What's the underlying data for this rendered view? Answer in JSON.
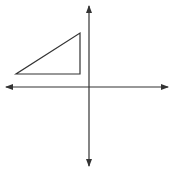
{
  "diagram": {
    "type": "coordinate-plane",
    "colors": {
      "background": "#ffffff",
      "stroke": "#333333"
    },
    "axes": {
      "origin_px": [
        89,
        87
      ],
      "x_axis": {
        "from_px": [
          6,
          87
        ],
        "to_px": [
          168,
          87
        ],
        "arrows": "both"
      },
      "y_axis": {
        "from_px": [
          89,
          6
        ],
        "to_px": [
          89,
          166
        ],
        "arrows": "both"
      }
    },
    "triangle": {
      "shape": "right-triangle",
      "quadrant": "II",
      "vertices_px": [
        [
          16,
          74
        ],
        [
          80,
          74
        ],
        [
          80,
          33
        ]
      ],
      "right_angle_at_px": [
        80,
        74
      ]
    }
  }
}
